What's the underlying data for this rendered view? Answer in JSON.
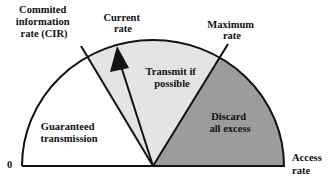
{
  "diagram": {
    "title_labels": {
      "cir": [
        "Commited",
        "information",
        "rate (CIR)"
      ],
      "current": [
        "Current",
        "rate"
      ],
      "maximum": [
        "Maximum",
        "rate"
      ],
      "access": [
        "Access",
        "rate"
      ],
      "zero": "0"
    },
    "regions": {
      "guaranteed": [
        "Guaranteed",
        "transmission"
      ],
      "transmit": [
        "Transmit if",
        "possible"
      ],
      "discard": [
        "Discard",
        "all excess"
      ]
    },
    "colors": {
      "guaranteed_fill": "#ffffff",
      "transmit_fill": "#e4e4e4",
      "discard_fill": "#9c9c9c",
      "stroke": "#111111"
    }
  }
}
